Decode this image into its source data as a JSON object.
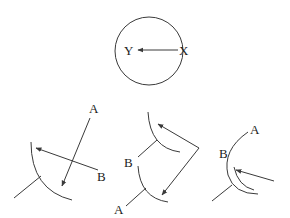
{
  "diagram": {
    "type": "physics-ray-reflection",
    "top": {
      "shape": "circle",
      "labels": {
        "start": "X",
        "end": "Y"
      },
      "arrow": "X to Y"
    },
    "panels": [
      {
        "id": "left",
        "labels": {
          "a": "A",
          "b": "B"
        }
      },
      {
        "id": "middle",
        "labels": {
          "a": "A",
          "b": "B"
        }
      },
      {
        "id": "right",
        "labels": {
          "a": "A",
          "b": "B"
        }
      }
    ]
  }
}
